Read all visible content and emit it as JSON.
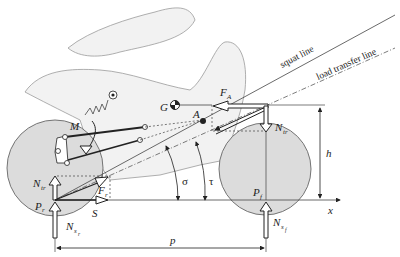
{
  "diagram": {
    "lines": {
      "squat_line": "squat line",
      "load_transfer_line": "load transfer line"
    },
    "points": {
      "G": "G",
      "A": "A",
      "M": "M",
      "Pr": "P",
      "Pr_sub": "r",
      "Pf": "P",
      "Pf_sub": "f"
    },
    "forces": {
      "FA": "F",
      "FA_sub": "A",
      "Ntr_front": "N",
      "Ntr_front_sub": "tr",
      "Ntr_rear": "N",
      "Ntr_rear_sub": "tr",
      "Fr": "F",
      "Fr_sub": "r",
      "S": "S",
      "Nsr": "N",
      "Nsr_sub": "s",
      "Nsr_subsub": "r",
      "Nsf": "N",
      "Nsf_sub": "s",
      "Nsf_subsub": "f"
    },
    "angles": {
      "sigma": "σ",
      "tau": "τ"
    },
    "dimensions": {
      "h": "h",
      "p": "p",
      "x": "x"
    },
    "colors": {
      "wheel_fill": "#dcdcdc",
      "body_fill": "#f2f2f2",
      "line": "#222222"
    }
  }
}
